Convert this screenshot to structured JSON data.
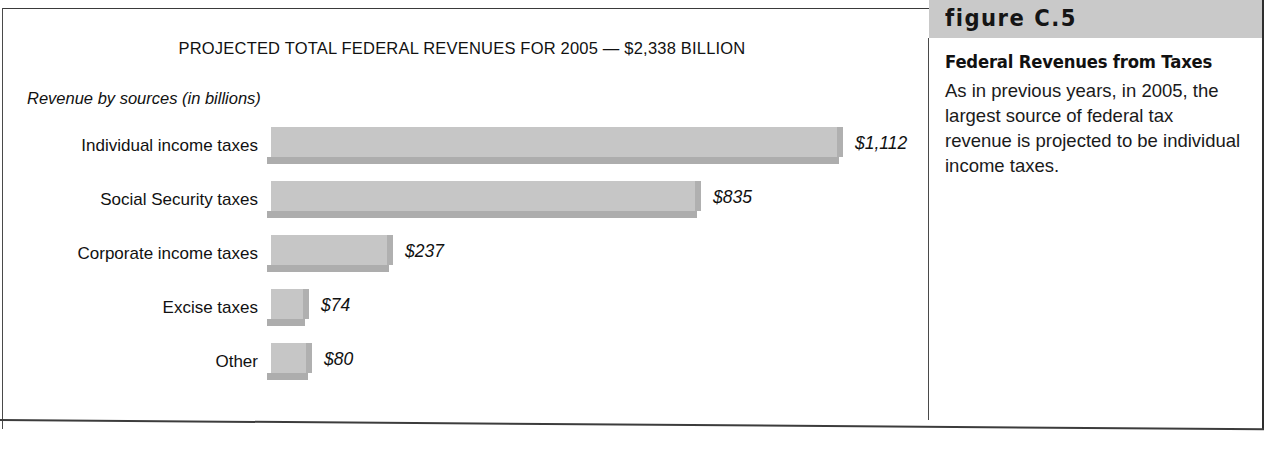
{
  "chart": {
    "title": "PROJECTED TOTAL FEDERAL REVENUES FOR 2005 — $2,338 BILLION",
    "subtitle": "Revenue by sources (in billions)"
  },
  "sidebar": {
    "figure_number": "figure C.5",
    "heading": "Federal Revenues from Taxes",
    "body": "As in previous years, in 2005, the largest source of federal tax revenue is projected to be individual income taxes."
  },
  "chart_data": {
    "type": "bar",
    "orientation": "horizontal",
    "title": "PROJECTED TOTAL FEDERAL REVENUES FOR 2005 — $2,338 BILLION",
    "subtitle": "Revenue by sources (in billions)",
    "xlabel": "",
    "ylabel": "",
    "units": "billions of dollars",
    "total": 2338,
    "grid": false,
    "legend": false,
    "categories": [
      "Individual income taxes",
      "Social Security taxes",
      "Corporate income taxes",
      "Excise taxes",
      "Other"
    ],
    "values": [
      1112,
      835,
      237,
      74,
      80
    ],
    "value_labels": [
      "$1,112",
      "$835",
      "$237",
      "$74",
      "$80"
    ],
    "xlim": [
      0,
      1112
    ],
    "bar_color": "#c6c6c6",
    "rows": [
      {
        "label": "Individual income taxes",
        "value": 1112,
        "value_label": "$1,112"
      },
      {
        "label": "Social Security taxes",
        "value": 835,
        "value_label": "$835"
      },
      {
        "label": "Corporate income taxes",
        "value": 237,
        "value_label": "$237"
      },
      {
        "label": "Excise taxes",
        "value": 74,
        "value_label": "$74"
      },
      {
        "label": "Other",
        "value": 80,
        "value_label": "$80"
      }
    ]
  }
}
